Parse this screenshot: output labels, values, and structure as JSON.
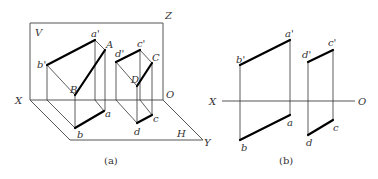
{
  "figure_a": {
    "caption": "(a)",
    "planes": {
      "V": "V",
      "H": "H"
    },
    "axes": {
      "X": "X",
      "Y": "Y",
      "Z": "Z",
      "O": "O"
    },
    "points": {
      "a_prime": "a'",
      "b_prime": "b'",
      "A": "A",
      "B": "B",
      "a": "a",
      "b": "b",
      "c_prime": "c'",
      "d_prime": "d'",
      "C": "C",
      "D": "D",
      "c": "c",
      "d": "d"
    }
  },
  "figure_b": {
    "caption": "(b)",
    "axes": {
      "X": "X",
      "O": "O"
    },
    "points": {
      "a_prime": "a'",
      "b_prime": "b'",
      "a": "a",
      "b": "b",
      "c_prime": "c'",
      "d_prime": "d'",
      "c": "c",
      "d": "d"
    }
  }
}
